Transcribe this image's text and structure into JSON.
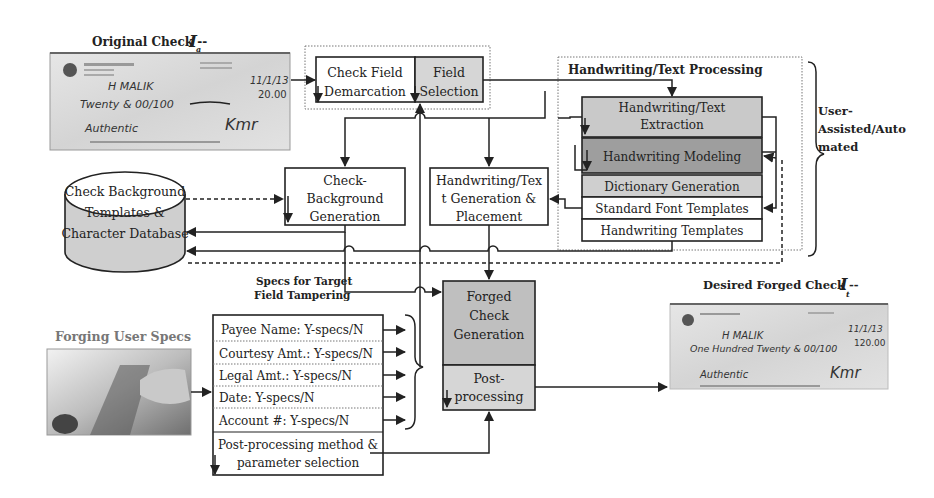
{
  "original_check": {
    "title": "Original Check --",
    "symbol": "I",
    "subscript": "a",
    "payee": "H MALIK",
    "amount_words": "Twenty & 00/100",
    "date": "11/1/13",
    "amount": "20.00",
    "memo": "Authentic",
    "signature": "Kmr"
  },
  "field_box": {
    "demarcation": [
      "Check Field",
      "Demarcation"
    ],
    "selection": [
      "Field",
      "Selection"
    ]
  },
  "hw_processing": {
    "title": "Handwriting/Text Processing",
    "extraction": [
      "Handwriting/Text",
      "Extraction"
    ],
    "modeling": "Handwriting Modeling",
    "dictionary": "Dictionary Generation",
    "std_font": "Standard Font Templates",
    "hw_templates": "Handwriting Templates"
  },
  "user_assisted": [
    "User-",
    "Assisted/Auto",
    "mated"
  ],
  "database": [
    "Check Background",
    "Templates  &",
    "Character Database"
  ],
  "check_bg_gen": [
    "Check-",
    "Background",
    "Generation"
  ],
  "hw_gen": [
    "Handwriting/Tex",
    "t Generation &",
    "Placement"
  ],
  "specs_label": [
    "Specs for Target",
    "Field Tampering"
  ],
  "forged_gen": [
    "Forged",
    "Check",
    "Generation"
  ],
  "post_proc": [
    "Post-",
    "processing"
  ],
  "forging_user_specs": "Forging User Specs",
  "spec_fields": [
    "Payee Name: Y-specs/N",
    "Courtesy Amt.: Y-specs/N",
    "Legal Amt.: Y-specs/N",
    "Date: Y-specs/N",
    "Account #: Y-specs/N"
  ],
  "post_method": [
    "Post-processing method &",
    "parameter selection"
  ],
  "desired_check": {
    "title": "Desired Forged Check --",
    "symbol": "I",
    "subscript": "t",
    "payee": "H MALIK",
    "amount_words": "One Hundred Twenty & 00/100",
    "date": "11/1/13",
    "amount": "120.00",
    "memo": "Authentic",
    "signature": "Kmr"
  },
  "colors": {
    "box_grey": "#bfbfbf",
    "box_light_grey": "#d6d6d6",
    "box_dark_grey": "#9e9e9e",
    "line": "#222222"
  }
}
